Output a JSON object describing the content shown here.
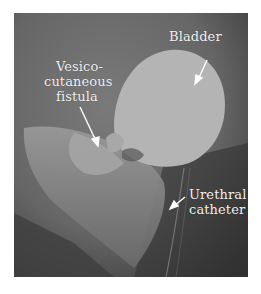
{
  "figure": {
    "type": "fluoroscopic cystogram",
    "labels": {
      "bladder": "Bladder",
      "fistula_line1": "Vesico-",
      "fistula_line2": "cutaneous",
      "fistula_line3": "fistula",
      "catheter_line1": "Urethral",
      "catheter_line2": "catheter"
    },
    "colors": {
      "background": "#6e6e6e",
      "contrast_fill": "#b4b4b4",
      "label_text": "#f2f2f2"
    }
  }
}
